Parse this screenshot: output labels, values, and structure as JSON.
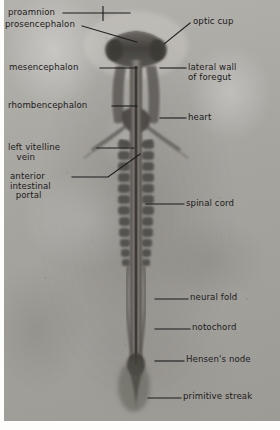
{
  "figure": {
    "kind": "labeled-photomicrograph",
    "background_color": "#a9a7a2",
    "ink_color": "#1b1b1b",
    "width": 280,
    "height": 430
  },
  "labels": [
    {
      "id": "proamnion",
      "text": "proamnion",
      "side": "left",
      "x": 8,
      "y": 8,
      "leader": {
        "x1": 63,
        "y1": 13,
        "x2": 130,
        "y2": 13
      },
      "tick": {
        "x": 103,
        "y1": 6,
        "y2": 21
      }
    },
    {
      "id": "prosencephalon",
      "text": "prosencephalon",
      "side": "left",
      "x": 5,
      "y": 20,
      "leader": {
        "x1": 82,
        "y1": 26,
        "x2": 137,
        "y2": 42
      }
    },
    {
      "id": "optic-cup",
      "text": "optic cup",
      "side": "right",
      "x": 193,
      "y": 17,
      "leader": {
        "x1": 190,
        "y1": 23,
        "x2": 164,
        "y2": 44
      }
    },
    {
      "id": "mesencephalon",
      "text": "mesencephalon",
      "side": "left",
      "x": 9,
      "y": 63,
      "leader": {
        "x1": 100,
        "y1": 68,
        "x2": 137,
        "y2": 68
      }
    },
    {
      "id": "lateral-wall-of-foregut",
      "text": "lateral wall\nof foregut",
      "side": "right",
      "x": 188,
      "y": 63,
      "leader": {
        "x1": 160,
        "y1": 68,
        "x2": 186,
        "y2": 68
      }
    },
    {
      "id": "rhombencephalon",
      "text": "rhombencephalon",
      "side": "left",
      "x": 8,
      "y": 101,
      "leader": {
        "x1": 112,
        "y1": 106,
        "x2": 137,
        "y2": 106
      }
    },
    {
      "id": "heart",
      "text": "heart",
      "side": "right",
      "x": 188,
      "y": 113,
      "leader": {
        "x1": 160,
        "y1": 118,
        "x2": 186,
        "y2": 118
      }
    },
    {
      "id": "left-vitelline-vein",
      "text": "left vitelline\n   vein",
      "side": "left",
      "x": 8,
      "y": 143,
      "leader": {
        "x1": 97,
        "y1": 148,
        "x2": 134,
        "y2": 148
      }
    },
    {
      "id": "anterior-intestinal-portal",
      "text": "anterior\nintestinal\n  portal",
      "side": "left",
      "x": 10,
      "y": 172,
      "leader": {
        "x1": 72,
        "y1": 177,
        "x2": 108,
        "y2": 177,
        "x3": 140,
        "y3": 154
      }
    },
    {
      "id": "spinal-cord",
      "text": "spinal cord",
      "side": "right",
      "x": 186,
      "y": 199,
      "leader": {
        "x1": 146,
        "y1": 204,
        "x2": 184,
        "y2": 204
      }
    },
    {
      "id": "neural-fold",
      "text": "neural fold",
      "side": "right",
      "x": 190,
      "y": 293,
      "leader": {
        "x1": 155,
        "y1": 299,
        "x2": 188,
        "y2": 299
      }
    },
    {
      "id": "notochord",
      "text": "notochord",
      "side": "right",
      "x": 192,
      "y": 323,
      "leader": {
        "x1": 155,
        "y1": 329,
        "x2": 190,
        "y2": 329
      }
    },
    {
      "id": "hensens-node",
      "text": "Hensen's node",
      "side": "right",
      "x": 186,
      "y": 355,
      "leader": {
        "x1": 155,
        "y1": 361,
        "x2": 184,
        "y2": 361
      }
    },
    {
      "id": "primitive-streak",
      "text": "primitive streak",
      "side": "right",
      "x": 183,
      "y": 392,
      "leader": {
        "x1": 148,
        "y1": 398,
        "x2": 181,
        "y2": 398
      }
    }
  ]
}
